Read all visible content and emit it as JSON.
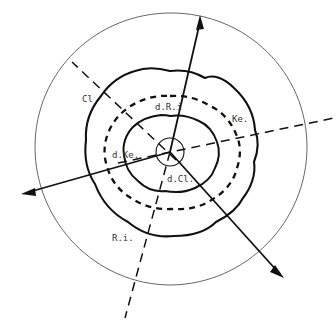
{
  "figure": {
    "kind": "concentric-contour-schematic",
    "background_color": "#ffffff",
    "ink_color": "#111111",
    "label_color": "#333333",
    "center": {
      "x": 170,
      "y": 152
    }
  },
  "labels": {
    "outer_contour": "Cl",
    "dashed_mid_contour": "d.R.i",
    "mid_contour": "Ke.",
    "inner_contour": "d.Ke.",
    "core_contour": "d.Cl.",
    "bottom_contour": "R.i."
  },
  "label_positions": {
    "outer_contour": {
      "x": 82,
      "y": 102
    },
    "dashed_mid_contour": {
      "x": 155,
      "y": 110
    },
    "mid_contour": {
      "x": 232,
      "y": 122
    },
    "inner_contour": {
      "x": 112,
      "y": 158
    },
    "core_contour": {
      "x": 167,
      "y": 182
    },
    "bottom_contour": {
      "x": 112,
      "y": 241
    }
  },
  "rings": [
    {
      "name": "outer-thin-circle",
      "stroke": "#555555",
      "width": 0.9,
      "dash": "none",
      "radius": 137
    },
    {
      "name": "outer-bold-contour",
      "stroke": "#111111",
      "width": 2.0,
      "dash": "none",
      "radius": 97
    },
    {
      "name": "dashed-contour",
      "stroke": "#111111",
      "width": 2.2,
      "dash": "6 5",
      "radius": 70
    },
    {
      "name": "inner-bold-contour",
      "stroke": "#111111",
      "width": 2.0,
      "dash": "none",
      "radius": 48
    },
    {
      "name": "core-circle",
      "stroke": "#111111",
      "width": 1.1,
      "dash": "none",
      "radius": 14
    }
  ],
  "axes": {
    "solid_arrows": [
      {
        "name": "axis-arrow-up",
        "from": {
          "x": 170,
          "y": 152
        },
        "to": {
          "x": 201,
          "y": 18
        }
      },
      {
        "name": "axis-arrow-down-right",
        "from": {
          "x": 170,
          "y": 152
        },
        "to": {
          "x": 282,
          "y": 276
        }
      },
      {
        "name": "axis-arrow-left",
        "from": {
          "x": 170,
          "y": 152
        },
        "to": {
          "x": 22,
          "y": 194
        }
      }
    ],
    "dashed_lines": [
      {
        "name": "dash-axis-right",
        "from": {
          "x": 170,
          "y": 152
        },
        "to": {
          "x": 334,
          "y": 118
        }
      },
      {
        "name": "dash-axis-upper-left",
        "from": {
          "x": 170,
          "y": 152
        },
        "to": {
          "x": 72,
          "y": 62
        }
      },
      {
        "name": "dash-axis-bottom",
        "from": {
          "x": 170,
          "y": 152
        },
        "to": {
          "x": 125,
          "y": 318
        }
      }
    ]
  }
}
